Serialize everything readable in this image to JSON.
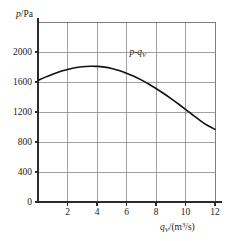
{
  "chart_data": {
    "type": "line",
    "title": "",
    "subtitle": "",
    "xlabel_parts": {
      "symbol": "q",
      "subscript": "V",
      "units": "/(m3/s)",
      "unit_base": "/(m",
      "unit_exp": "3",
      "unit_tail": "/s)"
    },
    "xlabel": "qV/(m3/s)",
    "ylabel_parts": {
      "symbol": "p",
      "units": "/Pa"
    },
    "ylabel": "p/Pa",
    "xlim": [
      0,
      12
    ],
    "ylim": [
      0,
      2400
    ],
    "xticks": [
      0,
      2,
      4,
      6,
      8,
      10,
      12
    ],
    "xticklabels": [
      "0",
      "2",
      "4",
      "6",
      "8",
      "10",
      "12"
    ],
    "yticks": [
      0,
      400,
      800,
      1200,
      1600,
      2000
    ],
    "yticklabels": [
      "0",
      "400",
      "800",
      "1200",
      "1600",
      "2000"
    ],
    "grid": true,
    "grid_x_values": [
      2,
      4,
      6,
      8,
      10
    ],
    "grid_y_values": [
      400,
      800,
      1200,
      1600,
      2000
    ],
    "legend": "none",
    "annotations": [
      {
        "text_symbol_1": "p",
        "text_dash": "-",
        "text_symbol_2": "q",
        "text_sub": "V",
        "text": "p-qV",
        "x": 6.2,
        "y": 1960
      }
    ],
    "series": [
      {
        "name": "p-qV",
        "x": [
          0,
          0.5,
          1,
          1.5,
          2,
          2.5,
          3,
          3.5,
          4,
          4.5,
          5,
          5.5,
          6,
          6.5,
          7,
          7.5,
          8,
          8.5,
          9,
          9.5,
          10,
          10.5,
          11,
          11.5,
          12
        ],
        "y": [
          1620,
          1665,
          1705,
          1740,
          1768,
          1790,
          1803,
          1810,
          1808,
          1798,
          1780,
          1753,
          1718,
          1676,
          1628,
          1574,
          1514,
          1450,
          1382,
          1310,
          1236,
          1160,
          1086,
          1020,
          970
        ]
      }
    ],
    "colors": {
      "curve": "#111111",
      "grid": "#8a8a8a",
      "axis": "#2b2b2b",
      "background": "#ffffff"
    }
  },
  "layout": {
    "plot_left": 38,
    "plot_right": 215,
    "plot_top": 22,
    "plot_bottom": 202
  }
}
